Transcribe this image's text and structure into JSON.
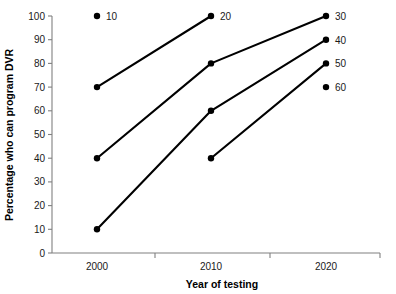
{
  "chart_data": {
    "type": "line",
    "title": "",
    "xlabel": "Year of testing",
    "ylabel": "Percentage who can program DVR",
    "categories": [
      "2000",
      "2010",
      "2020"
    ],
    "x": [
      2000,
      2010,
      2020
    ],
    "xlim": [
      1995,
      2025
    ],
    "ylim": [
      0,
      100
    ],
    "ytick_labels": [
      "0",
      "10",
      "20",
      "30",
      "40",
      "50",
      "60",
      "70",
      "80",
      "90",
      "100"
    ],
    "yticks": [
      0,
      10,
      20,
      30,
      40,
      50,
      60,
      70,
      80,
      90,
      100
    ],
    "grid": false,
    "legend": "none",
    "marker": "filled-circle",
    "line_color": "#000000",
    "axis_color": "#808080",
    "series": [
      {
        "name": "10",
        "label": "20",
        "points": [
          {
            "x": 2000,
            "y": 70
          },
          {
            "x": 2010,
            "y": 100
          }
        ]
      },
      {
        "name": "30",
        "label": "30",
        "points": [
          {
            "x": 2000,
            "y": 40
          },
          {
            "x": 2010,
            "y": 80
          },
          {
            "x": 2020,
            "y": 100
          }
        ]
      },
      {
        "name": "40",
        "label": "40",
        "points": [
          {
            "x": 2000,
            "y": 10
          },
          {
            "x": 2010,
            "y": 60
          },
          {
            "x": 2020,
            "y": 90
          }
        ]
      },
      {
        "name": "50",
        "label": "50",
        "points": [
          {
            "x": 2010,
            "y": 40
          },
          {
            "x": 2020,
            "y": 80
          }
        ]
      }
    ],
    "annotations": [
      {
        "label": "10",
        "x": 2000,
        "y": 100,
        "marker": true
      },
      {
        "label": "20",
        "x": 2010,
        "y": 100,
        "marker": false
      },
      {
        "label": "30",
        "x": 2020,
        "y": 100,
        "marker": false
      },
      {
        "label": "40",
        "x": 2020,
        "y": 90,
        "marker": false
      },
      {
        "label": "50",
        "x": 2020,
        "y": 80,
        "marker": false
      },
      {
        "label": "60",
        "x": 2020,
        "y": 70,
        "marker": true
      }
    ]
  }
}
